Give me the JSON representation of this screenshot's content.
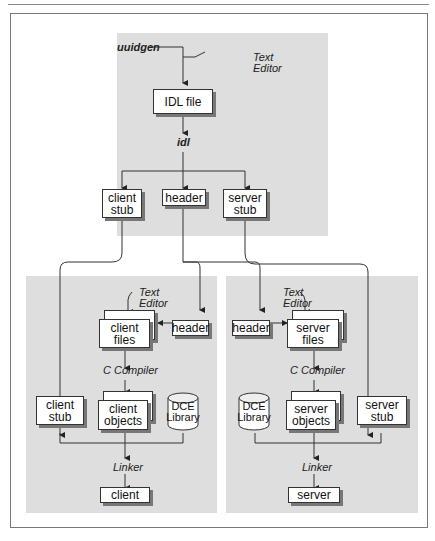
{
  "diagram": {
    "top_panel": {
      "uuidgen": "uuidgen",
      "text_editor_line1": "Text",
      "text_editor_line2": "Editor",
      "idl_file": "IDL file",
      "idl": "idl",
      "client_stub_line1": "client",
      "client_stub_line2": "stub",
      "header": "header",
      "server_stub_line1": "server",
      "server_stub_line2": "stub"
    },
    "client_panel": {
      "text_editor_line1": "Text",
      "text_editor_line2": "Editor",
      "client_files": "client files",
      "header": "header",
      "c_compiler": "C Compiler",
      "client_stub_line1": "client",
      "client_stub_line2": "stub",
      "client_objects_line1": "client",
      "client_objects_line2": "objects",
      "dce_library_line1": "DCE",
      "dce_library_line2": "Library",
      "linker": "Linker",
      "output": "client"
    },
    "server_panel": {
      "text_editor_line1": "Text",
      "text_editor_line2": "Editor",
      "header": "header",
      "server_files": "server files",
      "c_compiler": "C Compiler",
      "dce_library_line1": "DCE",
      "dce_library_line2": "Library",
      "server_objects_line1": "server",
      "server_objects_line2": "objects",
      "server_stub_line1": "server",
      "server_stub_line2": "stub",
      "linker": "Linker",
      "output": "server"
    }
  }
}
